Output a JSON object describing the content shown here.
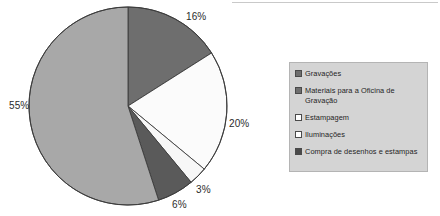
{
  "chart_data": {
    "type": "pie",
    "title": "",
    "categories": [
      "Gravações",
      "Materiais para a Oficina de Gravação",
      "Estampagem",
      "Iluminações",
      "Compra de desenhos e estampas"
    ],
    "values": [
      16,
      20,
      3,
      55,
      6
    ],
    "value_labels": [
      "16%",
      "20%",
      "3%",
      "55%",
      "6%"
    ],
    "unit": "%",
    "legend_position": "right",
    "grid": false,
    "slice_colors": [
      "#6e6e6e",
      "#fbfbfb",
      "#f7f7f7",
      "#a8a8a8",
      "#5a5a5a"
    ],
    "slices": [
      {
        "label": "16%",
        "value": 16,
        "color": "#6e6e6e",
        "category": "Gravações"
      },
      {
        "label": "20%",
        "value": 20,
        "color": "#fbfbfb",
        "category": "Materiais para a Oficina de Gravação"
      },
      {
        "label": "3%",
        "value": 3,
        "color": "#f7f7f7",
        "category": "Estampagem"
      },
      {
        "label": "6%",
        "value": 6,
        "color": "#5a5a5a",
        "category": "Iluminações"
      },
      {
        "label": "55%",
        "value": 55,
        "color": "#a8a8a8",
        "category": "Compra de desenhos e estampas"
      }
    ]
  },
  "labels": {
    "pct_16": "16%",
    "pct_20": "20%",
    "pct_3": "3%",
    "pct_6": "6%",
    "pct_55": "55%"
  },
  "legend": {
    "items": [
      {
        "label": "Gravações",
        "swatch": "#6e6e6e"
      },
      {
        "label": "Materiais para a Oficina de Gravação",
        "swatch": "#6e6e6e"
      },
      {
        "label": "Estampagem",
        "swatch": "#ffffff"
      },
      {
        "label": "Iluminações",
        "swatch": "#ffffff"
      },
      {
        "label": "Compra de desenhos e estampas",
        "swatch": "#4a4a4a"
      }
    ]
  },
  "colors": {
    "legend_background": "#d4d4d4",
    "legend_border": "#b4b4b4",
    "pie_outline": "#3c3c3c",
    "text": "#1f1f1f",
    "rule": "#c9c9c9"
  }
}
